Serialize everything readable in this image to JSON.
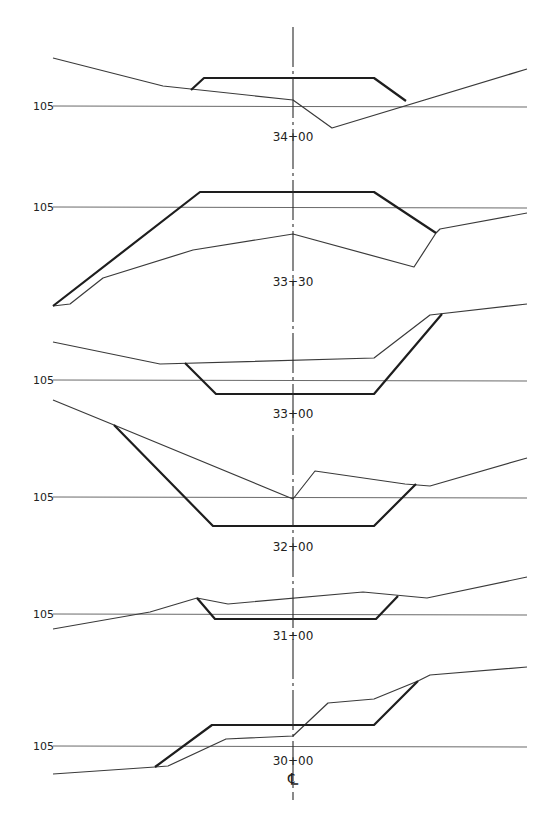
{
  "drawing": {
    "title_fragment_visible": "",
    "centerline": {
      "x": 293,
      "y_start": 27,
      "y_end": 800,
      "symbol": "℄"
    },
    "elevation_label": "105",
    "sections": [
      {
        "station": "34+00",
        "datum_y": 106,
        "label_pos": [
          293,
          141
        ],
        "ground": [
          [
            53,
            58
          ],
          [
            163,
            86
          ],
          [
            293,
            100
          ],
          [
            332,
            128
          ],
          [
            527,
            69
          ]
        ],
        "template": [
          [
            191,
            90
          ],
          [
            204,
            78
          ],
          [
            374,
            78
          ],
          [
            406,
            101
          ]
        ]
      },
      {
        "station": "33+30",
        "datum_y": 207,
        "label_pos": [
          293,
          286
        ],
        "ground": [
          [
            53,
            306
          ],
          [
            70,
            304
          ],
          [
            103,
            278
          ],
          [
            193,
            250
          ],
          [
            293,
            234
          ],
          [
            414,
            267
          ],
          [
            436,
            233
          ],
          [
            440,
            229
          ],
          [
            527,
            213
          ]
        ],
        "template": [
          [
            53,
            306
          ],
          [
            200,
            192
          ],
          [
            374,
            192
          ],
          [
            436,
            233
          ]
        ]
      },
      {
        "station": "33+00",
        "datum_y": 380,
        "label_pos": [
          293,
          418
        ],
        "ground": [
          [
            53,
            342
          ],
          [
            160,
            364
          ],
          [
            374,
            358
          ],
          [
            430,
            315
          ],
          [
            527,
            304
          ]
        ],
        "template": [
          [
            185,
            363
          ],
          [
            216,
            394
          ],
          [
            374,
            394
          ],
          [
            442,
            314
          ]
        ]
      },
      {
        "station": "32+00",
        "datum_y": 497,
        "label_pos": [
          293,
          551
        ],
        "ground": [
          [
            53,
            400
          ],
          [
            114,
            425
          ],
          [
            293,
            499
          ],
          [
            315,
            471
          ],
          [
            405,
            484
          ],
          [
            430,
            486
          ],
          [
            527,
            458
          ]
        ],
        "template": [
          [
            114,
            425
          ],
          [
            213,
            526
          ],
          [
            374,
            526
          ],
          [
            416,
            484
          ]
        ]
      },
      {
        "station": "31+00",
        "datum_y": 614,
        "label_pos": [
          293,
          640
        ],
        "ground": [
          [
            53,
            629
          ],
          [
            150,
            612
          ],
          [
            197,
            598
          ],
          [
            228,
            604
          ],
          [
            363,
            592
          ],
          [
            427,
            598
          ],
          [
            527,
            577
          ]
        ],
        "template": [
          [
            197,
            598
          ],
          [
            215,
            619
          ],
          [
            376,
            619
          ],
          [
            398,
            596
          ]
        ]
      },
      {
        "station": "30+00",
        "datum_y": 746,
        "label_pos": [
          293,
          765
        ],
        "ground": [
          [
            53,
            774
          ],
          [
            155,
            767
          ],
          [
            168,
            766
          ],
          [
            226,
            739
          ],
          [
            293,
            736
          ],
          [
            328,
            703
          ],
          [
            374,
            699
          ],
          [
            418,
            681
          ],
          [
            430,
            675
          ],
          [
            527,
            667
          ]
        ],
        "template": [
          [
            155,
            767
          ],
          [
            212,
            725
          ],
          [
            374,
            725
          ],
          [
            418,
            681
          ]
        ]
      }
    ],
    "datum_x_start": 53,
    "datum_x_end": 527,
    "elevation_label_x": 33
  }
}
